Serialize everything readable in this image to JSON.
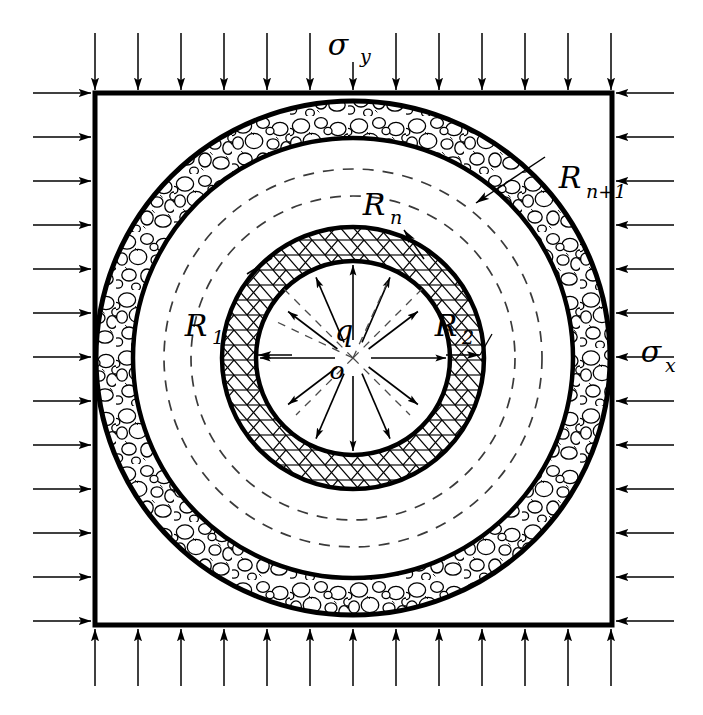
{
  "figure": {
    "domain_shape": "square",
    "colors": {
      "stroke": "#000000",
      "background": "#ffffff",
      "hatch_fill": "#ffffff",
      "gravel_fill": "#ffffff",
      "dashed_stroke": "#3a3a3a"
    }
  },
  "labels": {
    "sigma_y": {
      "base": "σ",
      "sub": "y",
      "text": "σy",
      "meaning": "vertical far-field stress",
      "x": 352,
      "y": 46
    },
    "sigma_x": {
      "base": "σ",
      "sub": "x",
      "text": "σx",
      "meaning": "horizontal far-field stress",
      "x": 660,
      "y": 362
    },
    "q": {
      "base": "q",
      "sub": "",
      "text": "q",
      "meaning": "internal pressure at cavity wall",
      "x": 344,
      "y": 341
    },
    "o": {
      "base": "o",
      "sub": "",
      "text": "o",
      "meaning": "origin / center of tunnel",
      "x": 337,
      "y": 372
    },
    "R1": {
      "base": "R",
      "sub": "1",
      "text": "R1",
      "meaning": "inner cavity radius",
      "x": 199,
      "y": 330
    },
    "R2": {
      "base": "R",
      "sub": "2",
      "text": "R2",
      "meaning": "outer radius of first lining layer",
      "x": 449,
      "y": 330
    },
    "Rn": {
      "base": "R",
      "sub": "n",
      "text": "Rn",
      "meaning": "inner radius of outermost layer",
      "x": 376,
      "y": 210
    },
    "Rn1": {
      "base": "R",
      "sub": "n+1",
      "text": "Rn+1",
      "meaning": "outer radius of outermost layer",
      "x": 520,
      "y": 183
    }
  },
  "geometry": {
    "center": {
      "x": 353,
      "y": 358
    },
    "square": {
      "x0": 95,
      "y0": 93,
      "x1": 612,
      "y1": 625,
      "stroke_width": 5
    },
    "rings": [
      {
        "name": "cavity-wall",
        "radius": 97,
        "stroke_width": 4.5,
        "label": "R1"
      },
      {
        "name": "hatch-ring-outer",
        "radius": 131,
        "stroke_width": 4.5,
        "label": "R2"
      },
      {
        "name": "dashed-inner",
        "radius": 162,
        "stroke_width": 1.6,
        "style": "dashed"
      },
      {
        "name": "dashed-outer",
        "radius": 189,
        "stroke_width": 1.6,
        "style": "dashed",
        "label": "Rn"
      },
      {
        "name": "gravel-ring-inner",
        "radius": 220,
        "stroke_width": 4.5
      },
      {
        "name": "gravel-ring-outer",
        "radius": 257,
        "stroke_width": 5.0,
        "label": "Rn+1"
      }
    ],
    "layer_patterns": [
      {
        "zone": "cavity",
        "pattern": "blank"
      },
      {
        "zone": "first-lining-layer",
        "pattern": "brick-hatch"
      },
      {
        "zone": "intermediate-layers",
        "pattern": "blank-with-dashed-circles"
      },
      {
        "zone": "outer-layer",
        "pattern": "gravel-aggregate"
      }
    ]
  },
  "load_arrows": {
    "top": {
      "count": 13,
      "direction": "down",
      "label_ref": "sigma_y",
      "length": 58,
      "spacing": 43,
      "start_x": 95
    },
    "bottom": {
      "count": 13,
      "direction": "up",
      "label_ref": "sigma_y",
      "length": 58,
      "spacing": 43,
      "start_x": 95
    },
    "left": {
      "count": 13,
      "direction": "right",
      "label_ref": "sigma_x",
      "length": 58,
      "spacing": 44,
      "start_y": 93
    },
    "right": {
      "count": 13,
      "direction": "left",
      "label_ref": "sigma_x",
      "length": 58,
      "spacing": 44,
      "start_y": 93
    },
    "internal": {
      "count": 12,
      "direction": "outward-radial",
      "label_ref": "q",
      "inner_radius": 18,
      "outer_radius": 93
    }
  }
}
